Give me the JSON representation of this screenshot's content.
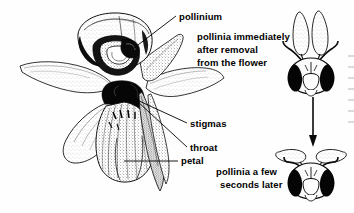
{
  "figure": {
    "background_color": "#fefefe",
    "ink_color": "#000000"
  },
  "labels": {
    "pollinium": "pollinium",
    "pollinia_after_removal_line1": "pollinia immediately",
    "pollinia_after_removal_line2": "after removal",
    "pollinia_after_removal_line3": "from the flower",
    "stigmas": "stigmas",
    "throat": "throat",
    "petal": "petal",
    "pollinia_later_line1": "pollinia a few",
    "pollinia_later_line2": "seconds later"
  },
  "parts": {
    "flower": "orchid-flower-illustration",
    "bee_top": "bee-head-with-upright-pollinia",
    "bee_bottom": "bee-head-with-bent-pollinia",
    "arrow": "downward-time-arrow"
  },
  "leader_lines": {
    "pollinium": "from label left to column apex",
    "stigmas": "from label left to dark throat centre",
    "throat": "from label left to dark throat centre",
    "petal": "horizontal from label left to lower petal"
  }
}
